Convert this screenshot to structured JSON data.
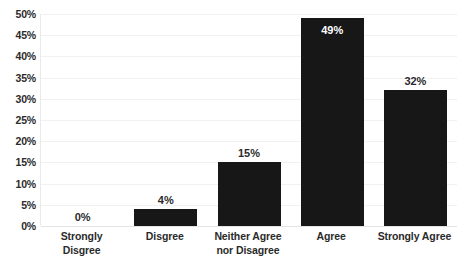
{
  "chart_data": {
    "type": "bar",
    "title": "",
    "subtitle": "",
    "xlabel": "",
    "ylabel": "",
    "categories": [
      "Strongly Disgree",
      "Disgree",
      "Neither Agree nor Disagree",
      "Agree",
      "Strongly Agree"
    ],
    "category_lines": [
      [
        "Strongly",
        "Disgree"
      ],
      [
        "Disgree"
      ],
      [
        "Neither Agree",
        "nor Disagree"
      ],
      [
        "Agree"
      ],
      [
        "Strongly Agree"
      ]
    ],
    "values": [
      0,
      4,
      15,
      49,
      32
    ],
    "data_labels": [
      "0%",
      "4%",
      "15%",
      "49%",
      "32%"
    ],
    "data_label_position": [
      "outside",
      "outside",
      "outside",
      "inside",
      "outside"
    ],
    "ylim": [
      0,
      50
    ],
    "ytick_values": [
      0,
      5,
      10,
      15,
      20,
      25,
      30,
      35,
      40,
      45,
      50
    ],
    "ytick_labels": [
      "0%",
      "5%",
      "10%",
      "15%",
      "20%",
      "25%",
      "30%",
      "35%",
      "40%",
      "45%",
      "50%"
    ],
    "grid": true,
    "legend": false,
    "legend_position": "none",
    "bar_color": "#171717",
    "gridline_color": "#f1f1f1",
    "axis_color": "#e4e4e4",
    "label_color": "#2b2b2b",
    "inside_label_color": "#ffffff",
    "background_color": "#ffffff"
  }
}
